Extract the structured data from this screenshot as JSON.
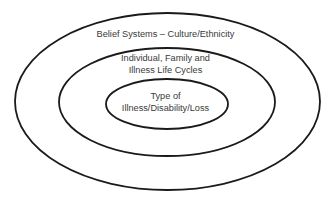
{
  "diagram": {
    "type": "concentric-ellipses",
    "stroke_color": "#1a1a1a",
    "text_color": "#3a3a3a",
    "background": "#ffffff",
    "layers": [
      {
        "id": "outer",
        "lines": [
          "Belief Systems – Culture/Ethnicity"
        ]
      },
      {
        "id": "middle",
        "lines": [
          "Individual, Family and",
          "Illness Life Cycles"
        ]
      },
      {
        "id": "inner",
        "lines": [
          "Type of",
          "Illness/Disability/Loss"
        ]
      }
    ]
  }
}
